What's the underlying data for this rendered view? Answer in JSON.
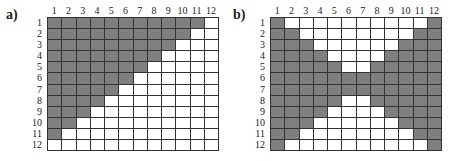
{
  "panels": [
    {
      "label": "a)",
      "col_labels": [
        "1",
        "2",
        "3",
        "4",
        "5",
        "6",
        "7",
        "8",
        "9",
        "10",
        "11",
        "12"
      ],
      "row_labels": [
        "1",
        "2",
        "3",
        "4",
        "5",
        "6",
        "7",
        "8",
        "9",
        "10",
        "11",
        "12"
      ],
      "filled_color": "#7f7f7f",
      "empty_color": "#ffffff",
      "matrix": [
        [
          1,
          1,
          1,
          1,
          1,
          1,
          1,
          1,
          1,
          1,
          1,
          0
        ],
        [
          1,
          1,
          1,
          1,
          1,
          1,
          1,
          1,
          1,
          1,
          0,
          0
        ],
        [
          1,
          1,
          1,
          1,
          1,
          1,
          1,
          1,
          1,
          0,
          0,
          0
        ],
        [
          1,
          1,
          1,
          1,
          1,
          1,
          1,
          1,
          0,
          0,
          0,
          0
        ],
        [
          1,
          1,
          1,
          1,
          1,
          1,
          1,
          0,
          0,
          0,
          0,
          0
        ],
        [
          1,
          1,
          1,
          1,
          1,
          1,
          0,
          0,
          0,
          0,
          0,
          0
        ],
        [
          1,
          1,
          1,
          1,
          1,
          0,
          0,
          0,
          0,
          0,
          0,
          0
        ],
        [
          1,
          1,
          1,
          1,
          0,
          0,
          0,
          0,
          0,
          0,
          0,
          0
        ],
        [
          1,
          1,
          1,
          0,
          0,
          0,
          0,
          0,
          0,
          0,
          0,
          0
        ],
        [
          1,
          1,
          0,
          0,
          0,
          0,
          0,
          0,
          0,
          0,
          0,
          0
        ],
        [
          1,
          0,
          0,
          0,
          0,
          0,
          0,
          0,
          0,
          0,
          0,
          0
        ],
        [
          0,
          0,
          0,
          0,
          0,
          0,
          0,
          0,
          0,
          0,
          0,
          0
        ]
      ]
    },
    {
      "label": "b)",
      "col_labels": [
        "1",
        "2",
        "3",
        "4",
        "5",
        "6",
        "7",
        "8",
        "9",
        "10",
        "11",
        "12"
      ],
      "row_labels": [
        "1",
        "2",
        "3",
        "4",
        "5",
        "6",
        "7",
        "8",
        "9",
        "10",
        "11",
        "12"
      ],
      "filled_color": "#7f7f7f",
      "empty_color": "#ffffff",
      "matrix": [
        [
          1,
          0,
          0,
          0,
          0,
          0,
          0,
          0,
          0,
          0,
          0,
          1
        ],
        [
          1,
          1,
          0,
          0,
          0,
          0,
          0,
          0,
          0,
          0,
          1,
          1
        ],
        [
          1,
          1,
          1,
          0,
          0,
          0,
          0,
          0,
          0,
          1,
          1,
          1
        ],
        [
          1,
          1,
          1,
          1,
          0,
          0,
          0,
          0,
          1,
          1,
          1,
          1
        ],
        [
          1,
          1,
          1,
          1,
          1,
          0,
          0,
          1,
          1,
          1,
          1,
          1
        ],
        [
          1,
          1,
          1,
          1,
          1,
          1,
          1,
          1,
          1,
          1,
          1,
          1
        ],
        [
          1,
          1,
          1,
          1,
          1,
          1,
          1,
          1,
          1,
          1,
          1,
          1
        ],
        [
          1,
          1,
          1,
          1,
          1,
          0,
          0,
          1,
          1,
          1,
          1,
          1
        ],
        [
          1,
          1,
          1,
          1,
          0,
          0,
          0,
          0,
          1,
          1,
          1,
          1
        ],
        [
          1,
          1,
          1,
          0,
          0,
          0,
          0,
          0,
          0,
          1,
          1,
          1
        ],
        [
          1,
          1,
          0,
          0,
          0,
          0,
          0,
          0,
          0,
          0,
          1,
          1
        ],
        [
          1,
          0,
          0,
          0,
          0,
          0,
          0,
          0,
          0,
          0,
          0,
          1
        ]
      ]
    }
  ]
}
